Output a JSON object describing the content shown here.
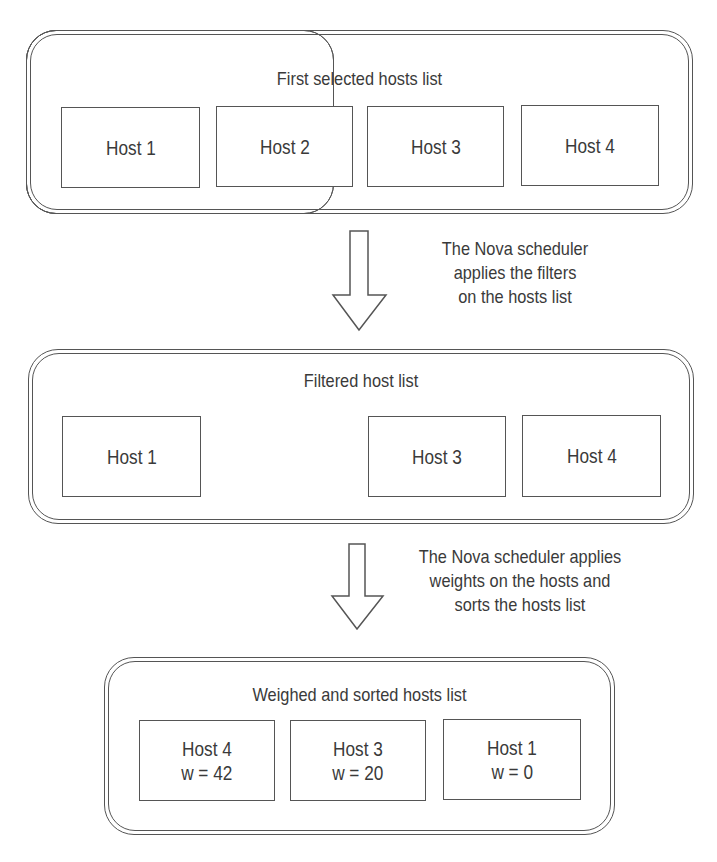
{
  "diagram": {
    "type": "flowchart",
    "stages": [
      {
        "title": "First selected hosts list",
        "hosts": [
          {
            "name": "Host 1"
          },
          {
            "name": "Host 2"
          },
          {
            "name": "Host 3"
          },
          {
            "name": "Host 4"
          }
        ]
      },
      {
        "title": "Filtered host list",
        "hosts": [
          {
            "name": "Host 1"
          },
          {
            "name": "Host 3"
          },
          {
            "name": "Host 4"
          }
        ]
      },
      {
        "title": "Weighed and sorted hosts list",
        "hosts": [
          {
            "name": "Host 4",
            "weight": "w = 42"
          },
          {
            "name": "Host 3",
            "weight": "w = 20"
          },
          {
            "name": "Host 1",
            "weight": "w = 0"
          }
        ]
      }
    ],
    "transitions": [
      {
        "arrow_icon": "down-arrow-icon",
        "lines": [
          "The Nova scheduler",
          "applies the filters",
          "on the hosts list"
        ]
      },
      {
        "arrow_icon": "down-arrow-icon",
        "lines": [
          "The Nova scheduler applies",
          "weights on the hosts and",
          "sorts the hosts list"
        ]
      }
    ],
    "colors": {
      "stroke": "#555555",
      "text": "#3a3a3a",
      "background": "#ffffff"
    }
  }
}
